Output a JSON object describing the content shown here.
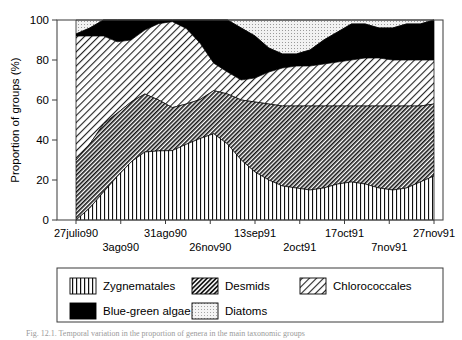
{
  "figure": {
    "caption_fragment": "Fig. 12.1. Temporal variation in the proportion of genera in the main taxonomic groups"
  },
  "chart_data": {
    "type": "area",
    "stacked": true,
    "normalized_percent": true,
    "title": "",
    "xlabel": "",
    "ylabel": "Proportion of groups (%)",
    "ylim": [
      0,
      100
    ],
    "yticks": [
      0,
      20,
      40,
      60,
      80,
      100
    ],
    "grid": false,
    "legend_position": "bottom",
    "x_tick_labels_upper": [
      "27julio90",
      "31ago90",
      "13sep91",
      "17oct91",
      "27nov91"
    ],
    "x_tick_labels_lower": [
      "3ago90",
      "26nov90",
      "2oct91",
      "7nov91"
    ],
    "x_tick_positions_upper": [
      0,
      0.25,
      0.5,
      0.75,
      1.0
    ],
    "x_tick_positions_lower": [
      0.125,
      0.375,
      0.625,
      0.875
    ],
    "x": [
      0,
      0.0385,
      0.0769,
      0.1154,
      0.1538,
      0.1923,
      0.2308,
      0.2692,
      0.3077,
      0.3462,
      0.3846,
      0.4231,
      0.4615,
      0.5,
      0.5385,
      0.5769,
      0.6154,
      0.6538,
      0.6923,
      0.7308,
      0.7692,
      0.8077,
      0.8462,
      0.8846,
      0.9231,
      0.9615,
      1.0
    ],
    "series": [
      {
        "name": "Zygnematales",
        "pattern": "vertical-lines",
        "values": [
          0,
          6,
          14,
          22,
          29,
          34,
          38,
          42,
          45,
          46,
          44,
          38,
          30,
          24,
          20,
          17,
          16,
          15,
          16,
          18,
          19,
          18,
          16,
          15,
          16,
          19,
          22
        ]
      },
      {
        "name": "Desmids",
        "pattern": "dense-diagonal-hatch",
        "values": [
          30,
          32,
          34,
          32,
          30,
          29,
          28,
          26,
          24,
          22,
          22,
          25,
          30,
          35,
          38,
          40,
          41,
          42,
          41,
          39,
          38,
          39,
          41,
          42,
          41,
          38,
          36
        ]
      },
      {
        "name": "Chlorococcales",
        "pattern": "sparse-diagonal-hatch",
        "values": [
          62,
          54,
          44,
          36,
          31,
          32,
          42,
          52,
          45,
          32,
          14,
          11,
          10,
          12,
          16,
          19,
          20,
          20,
          21,
          22,
          23,
          24,
          24,
          23,
          23,
          23,
          22
        ]
      },
      {
        "name": "Blue-green algae",
        "pattern": "solid-black",
        "values": [
          1,
          4,
          8,
          11,
          10,
          5,
          2,
          1,
          5,
          13,
          22,
          26,
          26,
          21,
          12,
          7,
          6,
          8,
          12,
          15,
          18,
          17,
          15,
          16,
          18,
          18,
          20
        ]
      },
      {
        "name": "Diatoms",
        "pattern": "light-dots",
        "values": [
          7,
          4,
          0,
          0,
          0,
          0,
          0,
          0,
          0,
          0,
          0,
          0,
          4,
          8,
          14,
          17,
          17,
          15,
          10,
          6,
          2,
          2,
          4,
          4,
          2,
          2,
          0
        ]
      }
    ]
  },
  "legend": {
    "items": [
      {
        "label": "Zygnematales",
        "pattern": "vertical-lines"
      },
      {
        "label": "Desmids",
        "pattern": "dense-diagonal-hatch"
      },
      {
        "label": "Chlorococcales",
        "pattern": "sparse-diagonal-hatch"
      },
      {
        "label": "Blue-green algae",
        "pattern": "solid-black"
      },
      {
        "label": "Diatoms",
        "pattern": "light-dots"
      }
    ]
  }
}
